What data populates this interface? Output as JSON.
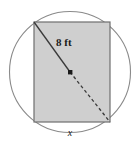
{
  "figure": {
    "name": "rectangle-inscribed-in-circle",
    "labels": {
      "diagonal": "8 ft",
      "bottom_side": "x"
    },
    "colors": {
      "rectangle_fill": "#cfcfcf",
      "rectangle_stroke": "#6e6e6e",
      "circle_stroke": "#8a8a8a",
      "diagonal_stroke": "#3a3a3a",
      "center_dot": "#1a1a1a",
      "background": "#ffffff"
    },
    "geometry": {
      "circle": {
        "cx": 70,
        "cy": 72,
        "r": 60.5
      },
      "rectangle": {
        "x": 34,
        "y": 22,
        "width": 76,
        "height": 100
      },
      "diagonal_solid": {
        "x1": 34,
        "y1": 22,
        "x2": 70,
        "y2": 72
      },
      "diagonal_dashed": {
        "x1": 70,
        "y1": 72,
        "x2": 110,
        "y2": 122
      },
      "center_dot": {
        "cx": 70,
        "cy": 72,
        "size": 4
      },
      "diagonal_label_pos": {
        "x": 56,
        "y": 46
      },
      "bottom_label_pos": {
        "x": 70,
        "y": 135
      }
    }
  }
}
